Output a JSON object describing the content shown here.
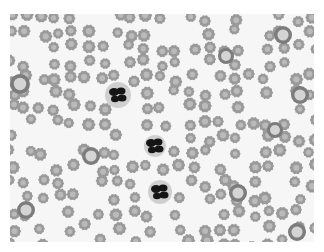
{
  "image": {
    "description": "Grayscale light-microscopy blood smear showing numerous crenated red blood cells (echinocytes) and three segmented neutrophils",
    "style": "grayscale",
    "background_color": "#f6f6f6",
    "rbc_color": "#9a9a9a",
    "rbc_center_color": "#c8c8c8",
    "nucleus_color": "#151515"
  },
  "neutrophils": [
    {
      "cx": 118,
      "cy": 95,
      "r": 13
    },
    {
      "cx": 155,
      "cy": 146,
      "r": 11
    },
    {
      "cx": 160,
      "cy": 192,
      "r": 12
    }
  ],
  "large_cells": [
    {
      "cx": 20,
      "cy": 84,
      "r": 10
    },
    {
      "cx": 91,
      "cy": 156,
      "r": 9
    },
    {
      "cx": 226,
      "cy": 56,
      "r": 8
    },
    {
      "cx": 283,
      "cy": 35,
      "r": 9
    },
    {
      "cx": 300,
      "cy": 95,
      "r": 9
    },
    {
      "cx": 275,
      "cy": 130,
      "r": 8
    },
    {
      "cx": 238,
      "cy": 193,
      "r": 9
    },
    {
      "cx": 297,
      "cy": 232,
      "r": 9
    },
    {
      "cx": 26,
      "cy": 210,
      "r": 9
    }
  ]
}
